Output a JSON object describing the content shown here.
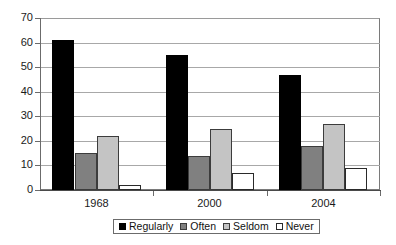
{
  "chart_data": {
    "type": "bar",
    "title": "",
    "subtitle": "",
    "xlabel": "",
    "ylabel": "",
    "categories": [
      "1968",
      "2000",
      "2004"
    ],
    "series": [
      {
        "name": "Regularly",
        "color": "#000000",
        "values": [
          61,
          55,
          47
        ]
      },
      {
        "name": "Often",
        "color": "#808080",
        "values": [
          15,
          14,
          18
        ]
      },
      {
        "name": "Seldom",
        "color": "#c4c4c4",
        "values": [
          22,
          25,
          27
        ]
      },
      {
        "name": "Never",
        "color": "#ffffff",
        "values": [
          2,
          7,
          9
        ]
      }
    ],
    "ylim": [
      0,
      70
    ],
    "ytick_step": 10,
    "ytick_labels": [
      "0",
      "10",
      "20",
      "30",
      "40",
      "50",
      "60",
      "70"
    ],
    "grid": true,
    "grid_axis": "y",
    "legend_position": "bottom",
    "legend_entries": [
      "Regularly",
      "Often",
      "Seldom",
      "Never"
    ]
  }
}
